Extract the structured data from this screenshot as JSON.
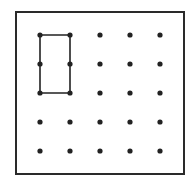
{
  "diagram": {
    "type": "geoboard",
    "frame": {
      "x": 16,
      "y": 12,
      "width": 168,
      "height": 162,
      "stroke": "#2a2a2a"
    },
    "grid": {
      "rows": 5,
      "cols": 5,
      "xs": [
        40,
        70,
        100,
        130,
        160
      ],
      "ys": [
        35,
        64,
        93,
        122,
        151
      ],
      "dot_color": "#222222",
      "dot_radius": 2.6
    },
    "shape": {
      "name": "rectangle",
      "points": [
        [
          0,
          0
        ],
        [
          1,
          0
        ],
        [
          1,
          2
        ],
        [
          0,
          2
        ]
      ],
      "stroke": "#222222"
    }
  }
}
